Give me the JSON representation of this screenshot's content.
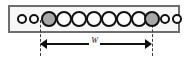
{
  "figure": {
    "type": "schematic-diagram",
    "background_color": "#ffffff"
  },
  "channel": {
    "name": "channel-rectangle",
    "border_color": "#6e6e6e",
    "fill_color": "#f7f7f7",
    "x": 8,
    "y": 5,
    "width": 172,
    "height": 28
  },
  "particles": {
    "outline_color": "#111111",
    "white_fill": "#ffffff",
    "gray_fill": "#a8a8a8",
    "small_diameter": 10,
    "large_diameter": 16,
    "count_total": 12,
    "count_small": 4,
    "count_large": 8,
    "count_gray": 2,
    "items": [
      {
        "index": 0,
        "size": "small",
        "fill": "white",
        "cx": 22,
        "cy": 19
      },
      {
        "index": 1,
        "size": "small",
        "fill": "white",
        "cx": 34,
        "cy": 19
      },
      {
        "index": 2,
        "size": "large",
        "fill": "gray",
        "cx": 49,
        "cy": 19
      },
      {
        "index": 3,
        "size": "large",
        "fill": "white",
        "cx": 64,
        "cy": 19
      },
      {
        "index": 4,
        "size": "large",
        "fill": "white",
        "cx": 79,
        "cy": 19
      },
      {
        "index": 5,
        "size": "large",
        "fill": "white",
        "cx": 94,
        "cy": 19
      },
      {
        "index": 6,
        "size": "large",
        "fill": "white",
        "cx": 109,
        "cy": 19
      },
      {
        "index": 7,
        "size": "large",
        "fill": "white",
        "cx": 124,
        "cy": 19
      },
      {
        "index": 8,
        "size": "large",
        "fill": "gray",
        "cx": 143,
        "cy": 19
      },
      {
        "index": 9,
        "size": "small",
        "fill": "white",
        "cx": 158,
        "cy": 19
      },
      {
        "index": 10,
        "size": "small",
        "fill": "white",
        "cx": 172,
        "cy": 19
      }
    ]
  },
  "guides": {
    "color": "#3b3b3b",
    "style": "dashed",
    "lines": [
      {
        "name": "left-guide",
        "x": 40,
        "y_top": 20,
        "y_bottom": 56
      },
      {
        "name": "right-guide",
        "x": 152,
        "y_top": 20,
        "y_bottom": 56
      }
    ]
  },
  "dimension": {
    "label": "W",
    "label_style": "italic",
    "arrow_color": "#111111",
    "x_start": 40,
    "x_end": 152,
    "y": 44,
    "length_px": 112
  }
}
